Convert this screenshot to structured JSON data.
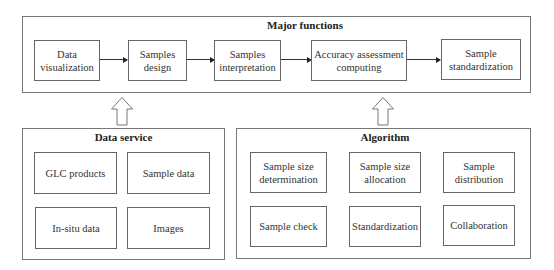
{
  "major_functions": {
    "title": "Major functions",
    "steps": [
      "Data\nvisualization",
      "Samples\ndesign",
      "Samples\ninterpretation",
      "Accuracy assessment\ncomputing",
      "Sample\nstandardization"
    ]
  },
  "data_service": {
    "title": "Data service",
    "items": [
      "GLC products",
      "Sample data",
      "In-situ data",
      "Images"
    ]
  },
  "algorithm": {
    "title": "Algorithm",
    "items": [
      "Sample size\ndetermination",
      "Sample size\nallocation",
      "Sample\ndistribution",
      "Sample check",
      "Standardization",
      "Collaboration"
    ]
  }
}
